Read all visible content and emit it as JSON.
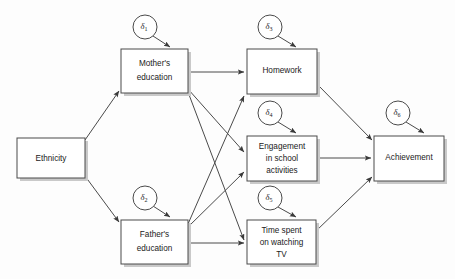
{
  "diagram": {
    "type": "path-diagram",
    "title": "",
    "background_color": "#fdfdfd",
    "line_color": "#4a4a4a",
    "node_fill": "#ffffff",
    "nodes": [
      {
        "id": "ethnicity",
        "label": "Ethnicity",
        "lines": [
          "Ethnicity"
        ],
        "shape": "rectangle",
        "x": 17,
        "y": 138,
        "w": 68,
        "h": 40
      },
      {
        "id": "mothers_education",
        "label": "Mother's education",
        "lines": [
          "Mother's",
          "education"
        ],
        "shape": "rectangle",
        "x": 121,
        "y": 49,
        "w": 67,
        "h": 44
      },
      {
        "id": "fathers_education",
        "label": "Father's education",
        "lines": [
          "Father's",
          "education"
        ],
        "shape": "rectangle",
        "x": 121,
        "y": 220,
        "w": 67,
        "h": 44
      },
      {
        "id": "homework",
        "label": "Homework",
        "lines": [
          "Homework"
        ],
        "shape": "rectangle",
        "x": 247,
        "y": 49,
        "w": 70,
        "h": 45
      },
      {
        "id": "engagement",
        "label": "Engagement in school activities",
        "lines": [
          "Engagement",
          "in school",
          "activities"
        ],
        "shape": "rectangle",
        "x": 247,
        "y": 136,
        "w": 70,
        "h": 45
      },
      {
        "id": "time_tv",
        "label": "Time spent on watching TV",
        "lines": [
          "Time spent",
          "on watching",
          "TV"
        ],
        "shape": "rectangle",
        "x": 247,
        "y": 220,
        "w": 69,
        "h": 44
      },
      {
        "id": "achievement",
        "label": "Achievement",
        "lines": [
          "Achievement"
        ],
        "shape": "rectangle",
        "x": 374,
        "y": 136,
        "w": 70,
        "h": 45
      }
    ],
    "errors": [
      {
        "id": "d1",
        "symbol": "δ",
        "subscript": "1",
        "label": "δ₁",
        "cx": 145,
        "cy": 27,
        "r": 12,
        "target": "mothers_education"
      },
      {
        "id": "d2",
        "symbol": "δ",
        "subscript": "2",
        "label": "δ₂",
        "cx": 145,
        "cy": 198,
        "r": 12,
        "target": "fathers_education"
      },
      {
        "id": "d3",
        "symbol": "δ",
        "subscript": "3",
        "label": "δ₃",
        "cx": 270,
        "cy": 27,
        "r": 12,
        "target": "homework"
      },
      {
        "id": "d4",
        "symbol": "δ",
        "subscript": "4",
        "label": "δ₄",
        "cx": 270,
        "cy": 113,
        "r": 12,
        "target": "engagement"
      },
      {
        "id": "d5",
        "symbol": "δ",
        "subscript": "5",
        "label": "δ₅",
        "cx": 270,
        "cy": 198,
        "r": 12,
        "target": "time_tv"
      },
      {
        "id": "d6",
        "symbol": "δ",
        "subscript": "6",
        "label": "δ₆",
        "cx": 398,
        "cy": 113,
        "r": 12,
        "target": "achievement"
      }
    ],
    "edges": [
      {
        "id": "e1",
        "from": "ethnicity",
        "to": "mothers_education",
        "label": ""
      },
      {
        "id": "e2",
        "from": "ethnicity",
        "to": "fathers_education",
        "label": ""
      },
      {
        "id": "e3",
        "from": "mothers_education",
        "to": "homework",
        "label": ""
      },
      {
        "id": "e4",
        "from": "mothers_education",
        "to": "engagement",
        "label": ""
      },
      {
        "id": "e5",
        "from": "mothers_education",
        "to": "time_tv",
        "label": ""
      },
      {
        "id": "e6",
        "from": "fathers_education",
        "to": "homework",
        "label": ""
      },
      {
        "id": "e7",
        "from": "fathers_education",
        "to": "engagement",
        "label": ""
      },
      {
        "id": "e8",
        "from": "fathers_education",
        "to": "time_tv",
        "label": ""
      },
      {
        "id": "e9",
        "from": "homework",
        "to": "achievement",
        "label": ""
      },
      {
        "id": "e10",
        "from": "engagement",
        "to": "achievement",
        "label": ""
      },
      {
        "id": "e11",
        "from": "time_tv",
        "to": "achievement",
        "label": ""
      },
      {
        "id": "e12",
        "from": "d1",
        "to": "mothers_education",
        "label": ""
      },
      {
        "id": "e13",
        "from": "d2",
        "to": "fathers_education",
        "label": ""
      },
      {
        "id": "e14",
        "from": "d3",
        "to": "homework",
        "label": ""
      },
      {
        "id": "e15",
        "from": "d4",
        "to": "engagement",
        "label": ""
      },
      {
        "id": "e16",
        "from": "d5",
        "to": "time_tv",
        "label": ""
      },
      {
        "id": "e17",
        "from": "d6",
        "to": "achievement",
        "label": ""
      }
    ]
  }
}
